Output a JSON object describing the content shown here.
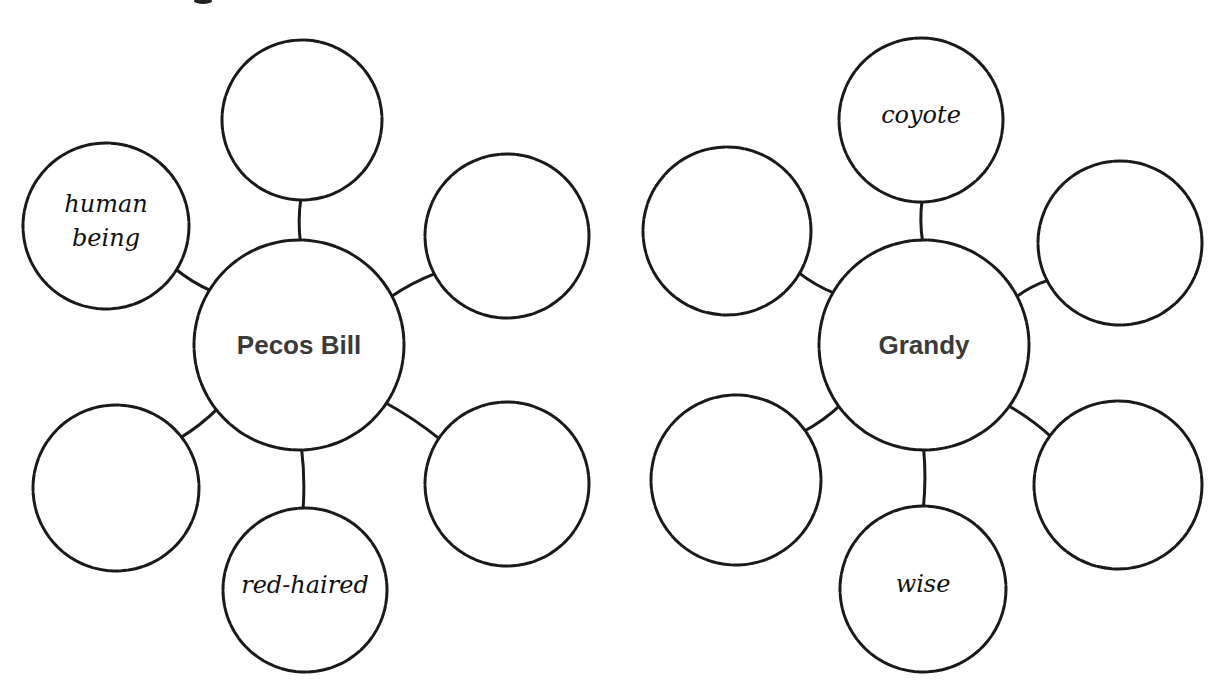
{
  "diagrams": [
    {
      "name": "pecos-bill-web",
      "center": {
        "label": "Pecos Bill",
        "cx": 299,
        "cy": 345,
        "r": 105
      },
      "nodes": [
        {
          "position": "top",
          "cx": 302,
          "cy": 120,
          "r": 80,
          "lines": []
        },
        {
          "position": "top-left",
          "cx": 106,
          "cy": 226,
          "r": 83,
          "lines": [
            "human",
            "being"
          ]
        },
        {
          "position": "top-right",
          "cx": 507,
          "cy": 236,
          "r": 82,
          "lines": []
        },
        {
          "position": "bottom-left",
          "cx": 116,
          "cy": 488,
          "r": 83,
          "lines": []
        },
        {
          "position": "bottom-right",
          "cx": 507,
          "cy": 484,
          "r": 82,
          "lines": []
        },
        {
          "position": "bottom",
          "cx": 305,
          "cy": 590,
          "r": 82,
          "lines": [
            "red-haired"
          ]
        }
      ]
    },
    {
      "name": "grandy-web",
      "center": {
        "label": "Grandy",
        "cx": 924,
        "cy": 345,
        "r": 105
      },
      "nodes": [
        {
          "position": "top",
          "cx": 921,
          "cy": 120,
          "r": 82,
          "lines": [
            "coyote"
          ]
        },
        {
          "position": "top-left",
          "cx": 727,
          "cy": 231,
          "r": 84,
          "lines": []
        },
        {
          "position": "top-right",
          "cx": 1120,
          "cy": 243,
          "r": 82,
          "lines": []
        },
        {
          "position": "bottom-left",
          "cx": 736,
          "cy": 480,
          "r": 85,
          "lines": []
        },
        {
          "position": "bottom-right",
          "cx": 1118,
          "cy": 485,
          "r": 84,
          "lines": []
        },
        {
          "position": "bottom",
          "cx": 923,
          "cy": 589,
          "r": 83,
          "lines": [
            "wise"
          ]
        }
      ]
    }
  ]
}
